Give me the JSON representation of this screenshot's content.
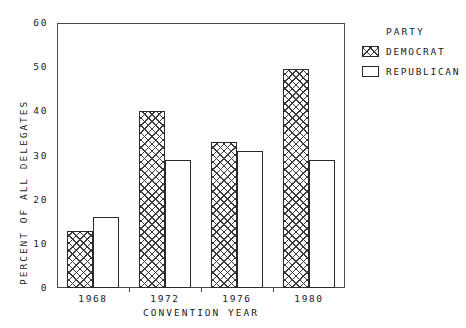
{
  "chart_data": {
    "type": "bar",
    "title": "",
    "xlabel": "CONVENTION YEAR",
    "ylabel": "PERCENT OF ALL DELEGATES",
    "categories": [
      "1968",
      "1972",
      "1976",
      "1980"
    ],
    "series": [
      {
        "name": "DEMOCRAT",
        "values": [
          13,
          40,
          33,
          49.5
        ]
      },
      {
        "name": "REPUBLICAN",
        "values": [
          16,
          29,
          31,
          29
        ]
      }
    ],
    "ylim": [
      0,
      60
    ],
    "yticks": [
      0,
      10,
      20,
      30,
      40,
      50,
      60
    ],
    "ytick_labels": [
      "0",
      "10",
      "20",
      "30",
      "40",
      "50",
      "60"
    ],
    "grid": false,
    "legend": {
      "title": "PARTY",
      "position": "right",
      "entries": [
        {
          "label": "DEMOCRAT",
          "swatch": "crosshatch"
        },
        {
          "label": "REPUBLICAN",
          "swatch": "empty"
        }
      ]
    },
    "colors": {
      "axis": "#4a4a4a",
      "bar_outline": "#2b2b2b",
      "hatch": "#3a3a3a",
      "background": "#ffffff"
    }
  }
}
